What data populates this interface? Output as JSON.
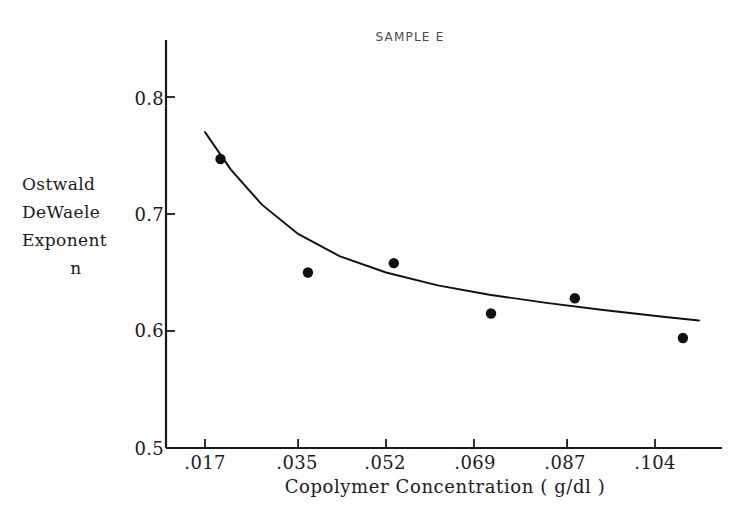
{
  "chart_data": {
    "type": "scatter",
    "title": "SAMPLE E",
    "xlabel": "Copolymer Concentration ( g/dl )",
    "ylabel": "Ostwald DeWaele Exponent n",
    "ylabel_lines": [
      "Ostwald",
      "DeWaele",
      "Exponent",
      "n"
    ],
    "xticks": [
      0.017,
      0.035,
      0.052,
      0.069,
      0.087,
      0.104
    ],
    "xtick_labels": [
      ".017",
      ".035",
      ".052",
      ".069",
      ".087",
      ".104"
    ],
    "yticks": [
      0.5,
      0.6,
      0.7,
      0.8
    ],
    "ytick_labels": [
      "0.5",
      "0.6",
      "0.7",
      "0.8"
    ],
    "xlim": [
      0.0085,
      0.1125
    ],
    "ylim": [
      0.5,
      0.83
    ],
    "grid": false,
    "legend": null,
    "series": [
      {
        "name": "measured points",
        "marker": "filled-circle",
        "x": [
          0.02,
          0.0369,
          0.0535,
          0.0723,
          0.0885,
          0.1094
        ],
        "y": [
          0.747,
          0.65,
          0.658,
          0.615,
          0.628,
          0.594
        ]
      },
      {
        "name": "fitted curve",
        "marker": "line",
        "x": [
          0.017,
          0.022,
          0.028,
          0.035,
          0.043,
          0.052,
          0.062,
          0.072,
          0.083,
          0.094,
          0.106,
          0.1125
        ],
        "y": [
          0.77,
          0.738,
          0.708,
          0.683,
          0.664,
          0.65,
          0.639,
          0.631,
          0.624,
          0.618,
          0.612,
          0.609
        ]
      }
    ],
    "axis_color": "#1a1a1a",
    "marker_color": "#101010",
    "curve_color": "#101010"
  }
}
